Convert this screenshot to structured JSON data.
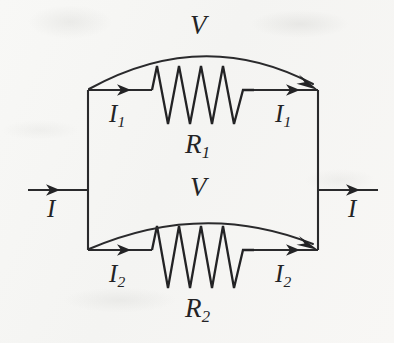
{
  "figure": {
    "kind": "circuit-diagram",
    "background_color": "#f7f7f5",
    "ink_color": "#232325"
  },
  "labels": {
    "voltage_top": {
      "symbol": "V",
      "subscript": ""
    },
    "voltage_bottom": {
      "symbol": "V",
      "subscript": ""
    },
    "resistor_top": {
      "symbol": "R",
      "subscript": "1"
    },
    "resistor_bottom": {
      "symbol": "R",
      "subscript": "2"
    },
    "current_in": {
      "symbol": "I",
      "subscript": ""
    },
    "current_out": {
      "symbol": "I",
      "subscript": ""
    },
    "branch_top_left": {
      "symbol": "I",
      "subscript": "1"
    },
    "branch_top_right": {
      "symbol": "I",
      "subscript": "1"
    },
    "branch_bottom_left": {
      "symbol": "I",
      "subscript": "2"
    },
    "branch_bottom_right": {
      "symbol": "I",
      "subscript": "2"
    }
  },
  "components": {
    "resistor_top_name": "resistor-r1",
    "resistor_bottom_name": "resistor-r2",
    "zigzag_peaks": 4
  }
}
